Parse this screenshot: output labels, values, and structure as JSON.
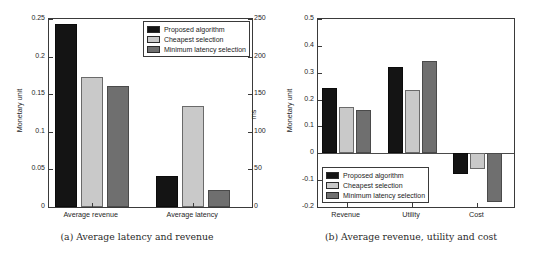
{
  "figure": {
    "panels": [
      {
        "id": "a",
        "caption": "(a) Average latency and revenue",
        "left_axis_title": "Monetary unit",
        "right_axis_title": "ms",
        "legend": {
          "position": "top-right",
          "entries": [
            {
              "label": "Proposed algorithm",
              "color": "#141414"
            },
            {
              "label": "Cheapest selection",
              "color": "#c9c9c9"
            },
            {
              "label": "Minimum latency selection",
              "color": "#6f6f6f"
            }
          ]
        }
      },
      {
        "id": "b",
        "caption": "(b) Average revenue, utility and cost",
        "left_axis_title": "Monetary unit",
        "legend": {
          "position": "bottom-left",
          "entries": [
            {
              "label": "Proposed algorithm",
              "color": "#141414"
            },
            {
              "label": "Cheapest selection",
              "color": "#c9c9c9"
            },
            {
              "label": "Minimum latency selection",
              "color": "#6f6f6f"
            }
          ]
        }
      }
    ]
  },
  "chart_data": [
    {
      "type": "bar",
      "panel": "a",
      "title": "(a) Average latency and revenue",
      "categories": [
        "Average revenue",
        "Average latency"
      ],
      "series": [
        {
          "name": "Proposed algorithm",
          "color": "#141414",
          "values": [
            0.243,
            0.041
          ]
        },
        {
          "name": "Cheapest selection",
          "color": "#c9c9c9",
          "values": [
            0.173,
            0.134
          ]
        },
        {
          "name": "Minimum latency selection",
          "color": "#6f6f6f",
          "values": [
            0.161,
            0.022
          ]
        }
      ],
      "note": "Average revenue bars are read on the left axis (Monetary unit); Average latency bars are read on the right axis (ms).",
      "latency_ms": {
        "Proposed algorithm": 41,
        "Cheapest selection": 134,
        "Minimum latency selection": 22
      },
      "xlabel": "",
      "ylabel": "Monetary unit",
      "y2label": "ms",
      "ylim": [
        0,
        0.25
      ],
      "y2lim": [
        0,
        250
      ],
      "yticks": [
        "0",
        "0.05",
        "0.1",
        "0.15",
        "0.2",
        "0.25"
      ],
      "ytick_values": [
        0,
        0.05,
        0.1,
        0.15,
        0.2,
        0.25
      ],
      "y2ticks": [
        "0",
        "50",
        "100",
        "150",
        "200",
        "250"
      ],
      "y2tick_values": [
        0,
        50,
        100,
        150,
        200,
        250
      ],
      "grid": false,
      "legend_position": "top right"
    },
    {
      "type": "bar",
      "panel": "b",
      "title": "(b) Average revenue, utility and cost",
      "categories": [
        "Revenue",
        "Utility",
        "Cost"
      ],
      "series": [
        {
          "name": "Proposed algorithm",
          "color": "#141414",
          "values": [
            0.243,
            0.32,
            -0.077
          ]
        },
        {
          "name": "Cheapest selection",
          "color": "#c9c9c9",
          "values": [
            0.174,
            0.234,
            -0.058
          ]
        },
        {
          "name": "Minimum latency selection",
          "color": "#6f6f6f",
          "values": [
            0.162,
            0.345,
            -0.183
          ]
        }
      ],
      "xlabel": "",
      "ylabel": "Monetary unit",
      "ylim": [
        -0.2,
        0.5
      ],
      "yticks": [
        "-0.2",
        "-0.1",
        "0",
        "0.1",
        "0.2",
        "0.3",
        "0.4",
        "0.5"
      ],
      "ytick_values": [
        -0.2,
        -0.1,
        0,
        0.1,
        0.2,
        0.3,
        0.4,
        0.5
      ],
      "grid": false,
      "legend_position": "bottom left"
    }
  ]
}
